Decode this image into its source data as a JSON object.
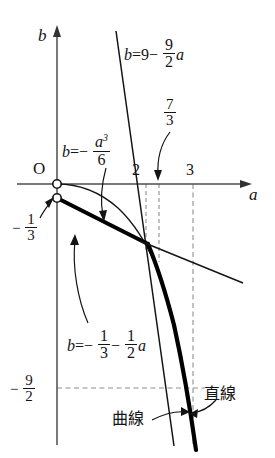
{
  "figure": {
    "axes": {
      "x_label": "a",
      "y_label": "b",
      "origin_label": "O"
    },
    "tick_labels": {
      "x_two": "2",
      "x_three": "3",
      "x_seven_thirds_num": "7",
      "x_seven_thirds_den": "3",
      "y_minus_one_third_sign": "−",
      "y_minus_one_third_num": "1",
      "y_minus_one_third_den": "3",
      "y_minus_nine_halves_sign": "−",
      "y_minus_nine_halves_num": "9",
      "y_minus_nine_halves_den": "2"
    },
    "equations": {
      "steep_line": {
        "lhs": "b",
        "eq": "=",
        "const": "9",
        "minus": "−",
        "slope_num": "9",
        "slope_den": "2",
        "var": "a"
      },
      "cubic_curve": {
        "lhs": "b",
        "eq": "=",
        "minus": "−",
        "num_var": "a",
        "num_pow": "3",
        "den": "6"
      },
      "tangent_line": {
        "lhs": "b",
        "eq": "=",
        "minus1": "−",
        "term1_num": "1",
        "term1_den": "3",
        "minus2": "−",
        "term2_num": "1",
        "term2_den": "2",
        "var": "a"
      }
    },
    "annotations": {
      "straight_line": "直線",
      "curve": "曲線"
    },
    "colors": {
      "ink": "#141414",
      "axis": "#4d4d4d",
      "dashed": "#8c8c8c"
    }
  }
}
